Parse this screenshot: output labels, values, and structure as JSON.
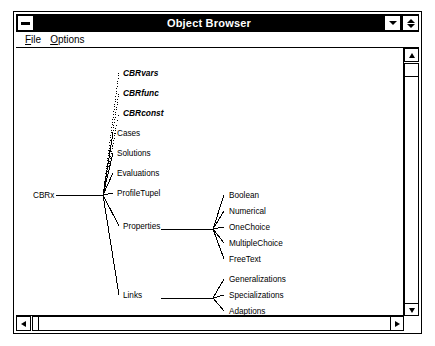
{
  "window": {
    "title": "Object Browser",
    "minimize_left_icon": "minus-icon",
    "minimize_icon": "triangle-down-icon",
    "restore_icon": "triangle-up-down-icon"
  },
  "menu": {
    "items": [
      {
        "label": "File",
        "accelerator": "F",
        "rest": "ile"
      },
      {
        "label": "Options",
        "accelerator": "O",
        "rest": "ptions"
      }
    ]
  },
  "scrollbars": {
    "vertical": {
      "up_icon": "arrow-up-icon",
      "down_icon": "arrow-down-icon"
    },
    "horizontal": {
      "left_icon": "arrow-left-icon",
      "right_icon": "arrow-right-icon"
    }
  },
  "tree": {
    "root": {
      "label": "CBRx",
      "x": 17,
      "y": 150,
      "anchor": "start"
    },
    "hub": {
      "x": 87,
      "y": 147
    },
    "branches": [
      {
        "label": "CBRvars",
        "style": "italic",
        "line": "dotted",
        "x": 107,
        "y": 28,
        "lx": 103,
        "ly": 25
      },
      {
        "label": "CBRfunc",
        "style": "italic",
        "line": "dotted",
        "x": 107,
        "y": 48,
        "lx": 103,
        "ly": 45
      },
      {
        "label": "CBRconst",
        "style": "italic",
        "line": "dotted",
        "x": 107,
        "y": 68,
        "lx": 103,
        "ly": 65
      },
      {
        "label": "Cases",
        "style": "regular",
        "line": "solid",
        "x": 101,
        "y": 88,
        "lx": 97,
        "ly": 85
      },
      {
        "label": "Solutions",
        "style": "regular",
        "line": "solid",
        "x": 101,
        "y": 108,
        "lx": 97,
        "ly": 105
      },
      {
        "label": "Evaluations",
        "style": "regular",
        "line": "solid",
        "x": 101,
        "y": 128,
        "lx": 97,
        "ly": 125
      },
      {
        "label": "ProfileTupel",
        "style": "regular",
        "line": "solid",
        "x": 101,
        "y": 148,
        "lx": 97,
        "ly": 145
      },
      {
        "label": "Properties",
        "style": "regular",
        "line": "solid",
        "x": 107,
        "y": 181,
        "lx": 103,
        "ly": 178
      },
      {
        "label": "Links",
        "style": "regular",
        "line": "solid",
        "x": 107,
        "y": 250,
        "lx": 103,
        "ly": 247
      }
    ],
    "properties_group": {
      "parent": "Properties",
      "hub": {
        "x": 197,
        "y": 181
      },
      "children": [
        {
          "label": "Boolean",
          "x": 213,
          "y": 150,
          "lx": 208,
          "ly": 147
        },
        {
          "label": "Numerical",
          "x": 213,
          "y": 166,
          "lx": 208,
          "ly": 163
        },
        {
          "label": "OneChoice",
          "x": 213,
          "y": 182,
          "lx": 208,
          "ly": 179
        },
        {
          "label": "MultipleChoice",
          "x": 213,
          "y": 198,
          "lx": 208,
          "ly": 195
        },
        {
          "label": "FreeText",
          "x": 213,
          "y": 214,
          "lx": 208,
          "ly": 211
        }
      ]
    },
    "links_group": {
      "parent": "Links",
      "hub": {
        "x": 197,
        "y": 250
      },
      "children": [
        {
          "label": "Generalizations",
          "x": 213,
          "y": 234,
          "lx": 208,
          "ly": 231
        },
        {
          "label": "Specializations",
          "x": 213,
          "y": 250,
          "lx": 208,
          "ly": 247
        },
        {
          "label": "Adaptions",
          "x": 213,
          "y": 266,
          "lx": 208,
          "ly": 263
        }
      ]
    }
  },
  "colors": {
    "titlebar_bg": "#000000",
    "titlebar_fg": "#ffffff",
    "window_bg": "#ffffff",
    "line": "#000000"
  }
}
